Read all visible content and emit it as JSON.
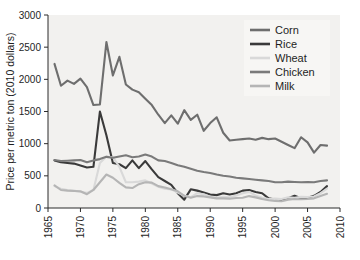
{
  "chart_data": {
    "type": "line",
    "title": "",
    "xlabel": "",
    "ylabel": "Price per metric ton (2010 dollars)",
    "xlim": [
      1965,
      2010
    ],
    "ylim": [
      0,
      3000
    ],
    "xticks": [
      1965,
      1970,
      1975,
      1980,
      1985,
      1990,
      1995,
      2000,
      2005,
      2010
    ],
    "xtick_labels": [
      "1965",
      "1970",
      "1975",
      "1980",
      "1985",
      "1990",
      "1995",
      "2000",
      "2005",
      "2010"
    ],
    "yticks": [
      0,
      500,
      1000,
      1500,
      2000,
      2500,
      3000
    ],
    "ytick_labels": [
      "0",
      "500",
      "1000",
      "1500",
      "2000",
      "2500",
      "3000"
    ],
    "grid": false,
    "legend_position": "upper right",
    "x": [
      1966,
      1967,
      1968,
      1969,
      1970,
      1971,
      1972,
      1973,
      1974,
      1975,
      1976,
      1977,
      1978,
      1979,
      1980,
      1981,
      1982,
      1983,
      1984,
      1985,
      1986,
      1987,
      1988,
      1989,
      1990,
      1991,
      1992,
      1993,
      1994,
      1995,
      1996,
      1997,
      1998,
      1999,
      2000,
      2001,
      2002,
      2003,
      2004,
      2005,
      2006,
      2007,
      2008
    ],
    "series": [
      {
        "name": "Corn",
        "color": "#6e6e6e",
        "values": [
          2240,
          1900,
          1980,
          1930,
          2010,
          1880,
          1600,
          1610,
          2580,
          2060,
          2350,
          1920,
          1840,
          1800,
          1700,
          1600,
          1450,
          1320,
          1440,
          1310,
          1520,
          1370,
          1450,
          1200,
          1320,
          1410,
          1170,
          1050,
          1060,
          1070,
          1080,
          1060,
          1090,
          1070,
          1080,
          1030,
          980,
          930,
          1100,
          1020,
          860,
          980,
          970
        ]
      },
      {
        "name": "Rice",
        "color": "#3a3a3a",
        "values": [
          740,
          710,
          700,
          690,
          660,
          630,
          640,
          1500,
          1130,
          700,
          680,
          620,
          740,
          620,
          730,
          600,
          480,
          420,
          360,
          230,
          130,
          290,
          270,
          240,
          210,
          200,
          230,
          210,
          230,
          270,
          280,
          250,
          230,
          150,
          130,
          120,
          150,
          190,
          150,
          160,
          190,
          250,
          340
        ]
      },
      {
        "name": "Wheat",
        "color": "#d9d9d9",
        "values": [
          340,
          300,
          280,
          270,
          250,
          235,
          280,
          700,
          800,
          790,
          640,
          400,
          400,
          410,
          430,
          380,
          330,
          300,
          290,
          240,
          190,
          170,
          230,
          215,
          175,
          160,
          175,
          165,
          195,
          230,
          250,
          195,
          160,
          140,
          145,
          140,
          165,
          160,
          175,
          170,
          180,
          230,
          300
        ]
      },
      {
        "name": "Chicken",
        "color": "#7a7a7a",
        "values": [
          745,
          730,
          735,
          740,
          745,
          710,
          740,
          760,
          795,
          780,
          800,
          820,
          790,
          800,
          830,
          800,
          740,
          730,
          700,
          665,
          640,
          610,
          580,
          560,
          545,
          520,
          500,
          490,
          470,
          460,
          450,
          440,
          430,
          420,
          400,
          400,
          410,
          405,
          400,
          405,
          400,
          420,
          430
        ]
      },
      {
        "name": "Milk",
        "color": "#b5b5b5",
        "values": [
          350,
          280,
          270,
          265,
          260,
          215,
          280,
          400,
          520,
          470,
          390,
          320,
          310,
          370,
          400,
          395,
          340,
          320,
          290,
          260,
          190,
          160,
          185,
          180,
          165,
          150,
          150,
          145,
          155,
          160,
          185,
          165,
          140,
          120,
          110,
          105,
          130,
          140,
          135,
          140,
          150,
          185,
          220
        ]
      }
    ],
    "legend": [
      {
        "label": "Corn",
        "color": "#6e6e6e"
      },
      {
        "label": "Rice",
        "color": "#3a3a3a"
      },
      {
        "label": "Wheat",
        "color": "#d9d9d9"
      },
      {
        "label": "Chicken",
        "color": "#7a7a7a"
      },
      {
        "label": "Milk",
        "color": "#b5b5b5"
      }
    ]
  },
  "colors": {
    "plot_background": "#f2f1ef",
    "legend_background": "#f7f6f4",
    "axis": "#2b2b2b",
    "text": "#1e1e1e"
  }
}
